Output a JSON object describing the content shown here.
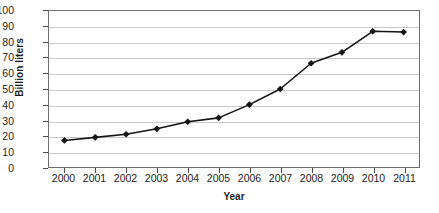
{
  "chart_data": {
    "type": "line",
    "title": "",
    "xlabel": "Year",
    "ylabel": "Billion liters",
    "categories": [
      "2000",
      "2001",
      "2002",
      "2003",
      "2004",
      "2005",
      "2006",
      "2007",
      "2008",
      "2009",
      "2010",
      "2011"
    ],
    "values": [
      17,
      19,
      21,
      24.5,
      29,
      31.5,
      40,
      50,
      66.5,
      73.5,
      87,
      86.5
    ],
    "series": [
      {
        "name": "Billion liters",
        "values": [
          17,
          19,
          21,
          24.5,
          29,
          31.5,
          40,
          50,
          66.5,
          73.5,
          87,
          86.5
        ]
      }
    ],
    "ylim": [
      0,
      100
    ],
    "ytick_step": 10,
    "yticks": [
      0,
      10,
      20,
      30,
      40,
      50,
      60,
      70,
      80,
      90,
      100
    ],
    "ytick_labels": [
      "0",
      "10",
      "20",
      "30",
      "40",
      "50",
      "60",
      "70",
      "80",
      "90",
      "100"
    ],
    "xtick_labels": [
      "2000",
      "2001",
      "2002",
      "2003",
      "2004",
      "2005",
      "2006",
      "2007",
      "2008",
      "2009",
      "2010",
      "2011"
    ],
    "grid": true,
    "grid_axis": "y",
    "legend": false,
    "legend_position": "none",
    "marker": "diamond",
    "line_color": "#141414",
    "marker_color": "#141414",
    "grid_color": "#c9c9c9",
    "axis_color": "#6f6f6f",
    "text_color": "#1b1b1b",
    "background_color": "#ffffff"
  }
}
